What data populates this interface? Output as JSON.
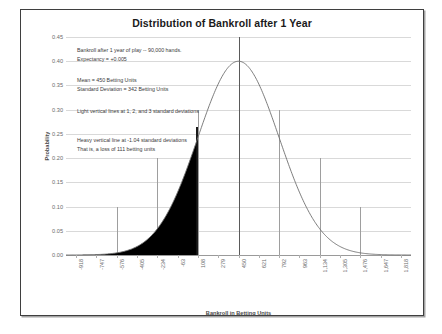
{
  "chart_data": {
    "type": "line",
    "title": "Distribution of Bankroll after 1 Year",
    "xlabel": "Bankroll in Betting Units",
    "ylabel": "Probability",
    "grid": true,
    "legend": "none",
    "xlim": [
      -1003.5,
      1903.5
    ],
    "ylim": [
      0.0,
      0.45
    ],
    "x_tick_labels": [
      "-918",
      "-747",
      "-576",
      "-405",
      "-234",
      "-63",
      "108",
      "279",
      "450",
      "621",
      "792",
      "963",
      "1,134",
      "1,305",
      "1,476",
      "1,647",
      "1,818"
    ],
    "x_tick_values": [
      -918,
      -747,
      -576,
      -405,
      -234,
      -63,
      108,
      279,
      450,
      621,
      792,
      963,
      1134,
      1305,
      1476,
      1647,
      1818
    ],
    "y_tick_labels": [
      "0.00",
      "0.05",
      "0.10",
      "0.15",
      "0.20",
      "0.25",
      "0.30",
      "0.35",
      "0.40",
      "0.45"
    ],
    "y_tick_values": [
      0.0,
      0.05,
      0.1,
      0.15,
      0.2,
      0.25,
      0.3,
      0.35,
      0.4,
      0.45
    ],
    "distribution": {
      "kind": "normal",
      "mean": 450,
      "std_dev": 342,
      "peak_probability": 0.4
    },
    "series": [
      {
        "name": "Normal density (scaled)",
        "x": [
          -918,
          -747,
          -576,
          -405,
          -234,
          -63,
          108,
          279,
          450,
          621,
          792,
          963,
          1134,
          1305,
          1476,
          1647,
          1818
        ],
        "values": [
          0.0004,
          0.0018,
          0.0066,
          0.0198,
          0.049,
          0.0997,
          0.1664,
          0.2284,
          0.2575,
          0.2284,
          0.1664,
          0.0997,
          0.049,
          0.0198,
          0.0066,
          0.0018,
          0.0004
        ]
      }
    ],
    "vertical_markers": [
      {
        "name": "minus-3-sd",
        "x": -576,
        "top_value": 0.1,
        "weight": "light"
      },
      {
        "name": "minus-2-sd",
        "x": -234,
        "top_value": 0.2,
        "weight": "light"
      },
      {
        "name": "minus-1-sd",
        "x": 108,
        "top_value": 0.3,
        "weight": "light"
      },
      {
        "name": "mean",
        "x": 450,
        "top_value": 0.45,
        "weight": "heavy-center"
      },
      {
        "name": "plus-1-sd",
        "x": 792,
        "top_value": 0.3,
        "weight": "light"
      },
      {
        "name": "plus-2-sd",
        "x": 1134,
        "top_value": 0.2,
        "weight": "light"
      },
      {
        "name": "plus-3-sd",
        "x": 1476,
        "top_value": 0.1,
        "weight": "light"
      },
      {
        "name": "minus-1.04-sd-threshold",
        "x": 94,
        "top_value": 0.265,
        "weight": "heavy"
      }
    ],
    "shaded_region": {
      "name": "loss-region",
      "from_x": -1003.5,
      "to_x": 94,
      "color": "#000000",
      "meaning": "probability of a loss of 111 betting units or worse"
    },
    "annotations": [
      {
        "name": "annotation-hands",
        "lines": [
          "Bankroll after 1 year of play  --  90,000 hands.",
          "Expectancy = +0.005"
        ]
      },
      {
        "name": "annotation-mean-sd",
        "lines": [
          "Mean = 450 Betting Units",
          "Standard Deviation = 342 Betting Units"
        ]
      },
      {
        "name": "annotation-light-lines",
        "lines": [
          "Light vertical lines at 1, 2, and 3 standard deviations"
        ]
      },
      {
        "name": "annotation-heavy-line",
        "lines": [
          "Heavy vertical line at -1.04 standard deviations",
          "That is, a loss of 111 betting units"
        ]
      }
    ],
    "colors": {
      "curve": "#6e6e6e",
      "grid": "#d9d9d9",
      "shade": "#000000",
      "light_marker": "#9e9e9e",
      "heavy_marker": "#1a1a1a",
      "frame": "#3f3f3f"
    }
  }
}
